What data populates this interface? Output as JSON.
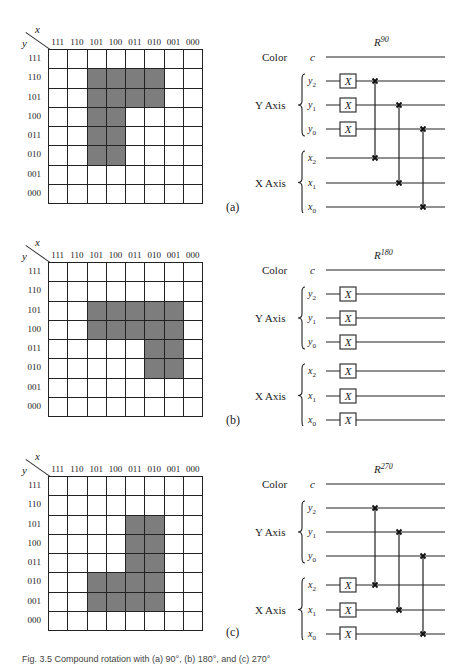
{
  "figure": {
    "caption": "Fig. 3.5 Compound rotation with (a) 90°, (b) 180°, and (c) 270°",
    "axis_label_x": "x",
    "axis_label_y": "y",
    "column_labels": [
      "111",
      "110",
      "101",
      "100",
      "011",
      "010",
      "001",
      "000"
    ],
    "row_labels": [
      "111",
      "110",
      "101",
      "100",
      "011",
      "010",
      "001",
      "000"
    ],
    "circuit_labels": {
      "color": "Color",
      "color_wire": "c",
      "y_axis": "Y Axis",
      "x_axis": "X Axis",
      "y_wires": [
        "y2",
        "y1",
        "y0"
      ],
      "x_wires": [
        "x2",
        "x1",
        "x0"
      ],
      "gate": "X"
    },
    "panels": [
      {
        "id": "a",
        "label": "(a)",
        "circuit_title": "R",
        "circuit_title_sup": "90",
        "filled_cells": [
          [
            1,
            2
          ],
          [
            1,
            3
          ],
          [
            1,
            4
          ],
          [
            1,
            5
          ],
          [
            2,
            2
          ],
          [
            2,
            3
          ],
          [
            2,
            4
          ],
          [
            2,
            5
          ],
          [
            3,
            2
          ],
          [
            3,
            3
          ],
          [
            4,
            2
          ],
          [
            4,
            3
          ],
          [
            5,
            2
          ],
          [
            5,
            3
          ]
        ],
        "x_gates_on": [
          "y2",
          "y1",
          "y0"
        ],
        "swaps": [
          [
            "y2",
            "x2"
          ],
          [
            "y1",
            "x1"
          ],
          [
            "y0",
            "x0"
          ]
        ]
      },
      {
        "id": "b",
        "label": "(b)",
        "circuit_title": "R",
        "circuit_title_sup": "180",
        "filled_cells": [
          [
            2,
            2
          ],
          [
            2,
            3
          ],
          [
            2,
            4
          ],
          [
            2,
            5
          ],
          [
            2,
            6
          ],
          [
            3,
            2
          ],
          [
            3,
            3
          ],
          [
            3,
            4
          ],
          [
            3,
            5
          ],
          [
            3,
            6
          ],
          [
            4,
            5
          ],
          [
            4,
            6
          ],
          [
            5,
            5
          ],
          [
            5,
            6
          ]
        ],
        "x_gates_on": [
          "y2",
          "y1",
          "y0",
          "x2",
          "x1",
          "x0"
        ],
        "swaps": []
      },
      {
        "id": "c",
        "label": "(c)",
        "circuit_title": "R",
        "circuit_title_sup": "270",
        "filled_cells": [
          [
            2,
            4
          ],
          [
            2,
            5
          ],
          [
            3,
            4
          ],
          [
            3,
            5
          ],
          [
            4,
            4
          ],
          [
            4,
            5
          ],
          [
            5,
            2
          ],
          [
            5,
            3
          ],
          [
            5,
            4
          ],
          [
            5,
            5
          ],
          [
            6,
            2
          ],
          [
            6,
            3
          ],
          [
            6,
            4
          ],
          [
            6,
            5
          ]
        ],
        "x_gates_on": [
          "x2",
          "x1",
          "x0"
        ],
        "swaps": [
          [
            "y2",
            "x2"
          ],
          [
            "y1",
            "x1"
          ],
          [
            "y0",
            "x0"
          ]
        ]
      }
    ]
  }
}
